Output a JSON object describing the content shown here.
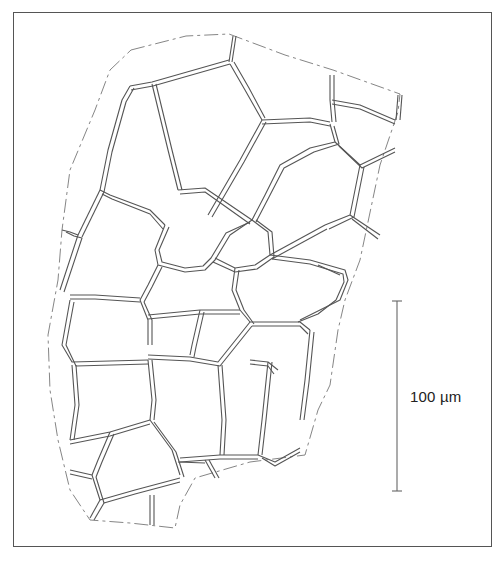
{
  "figure": {
    "type": "botanical-line-drawing",
    "scale_bar": {
      "label": "100 µm",
      "orientation": "vertical"
    },
    "colors": {
      "line": "#555555",
      "dashed_outline": "#777777",
      "frame": "#555555",
      "background": "#ffffff"
    }
  }
}
